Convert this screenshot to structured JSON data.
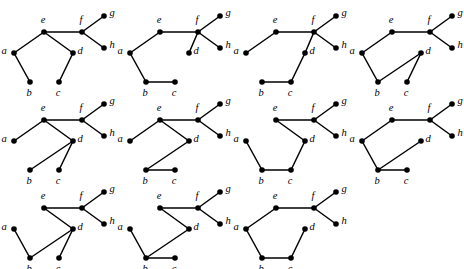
{
  "figure": {
    "caption": "",
    "vertex_labels": [
      "a",
      "b",
      "c",
      "d",
      "e",
      "f",
      "g",
      "h"
    ],
    "columns": 4,
    "rows": 3,
    "graph_count": 11,
    "vertex_radius": 2.8,
    "colors": {
      "edge": "#000000",
      "vertex": "#000000",
      "background": "#ffffff",
      "label": "#000000"
    },
    "layout": {
      "cell_width": 116,
      "cell_height": 88,
      "positions": {
        "a": {
          "x": 14,
          "y": 53
        },
        "b": {
          "x": 30,
          "y": 82
        },
        "c": {
          "x": 59,
          "y": 82
        },
        "d": {
          "x": 73,
          "y": 53
        },
        "e": {
          "x": 44,
          "y": 32
        },
        "f": {
          "x": 82,
          "y": 32
        },
        "g": {
          "x": 104,
          "y": 16
        },
        "h": {
          "x": 104,
          "y": 48
        }
      },
      "label_offsets": {
        "a": {
          "dx": -10,
          "dy": -1
        },
        "b": {
          "dx": -1,
          "dy": 12
        },
        "c": {
          "dx": -1,
          "dy": 12
        },
        "d": {
          "dx": 7,
          "dy": -1
        },
        "e": {
          "dx": -1,
          "dy": -11
        },
        "f": {
          "dx": -1,
          "dy": -11
        },
        "g": {
          "dx": 8,
          "dy": -2
        },
        "h": {
          "dx": 8,
          "dy": -2
        }
      }
    },
    "graphs": [
      {
        "id": "graph-1",
        "name": "graph-1",
        "row": 0,
        "col": 0,
        "edges": [
          [
            "a",
            "e"
          ],
          [
            "e",
            "f"
          ],
          [
            "e",
            "d"
          ],
          [
            "f",
            "g"
          ],
          [
            "f",
            "h"
          ],
          [
            "a",
            "b"
          ],
          [
            "d",
            "c"
          ]
        ]
      },
      {
        "id": "graph-2",
        "name": "graph-2",
        "row": 0,
        "col": 1,
        "edges": [
          [
            "a",
            "e"
          ],
          [
            "e",
            "f"
          ],
          [
            "f",
            "d"
          ],
          [
            "f",
            "g"
          ],
          [
            "f",
            "h"
          ],
          [
            "a",
            "b"
          ],
          [
            "b",
            "c"
          ]
        ]
      },
      {
        "id": "graph-3",
        "name": "graph-3",
        "row": 0,
        "col": 2,
        "edges": [
          [
            "a",
            "e"
          ],
          [
            "e",
            "f"
          ],
          [
            "f",
            "d"
          ],
          [
            "f",
            "g"
          ],
          [
            "f",
            "h"
          ],
          [
            "d",
            "c"
          ],
          [
            "c",
            "b"
          ]
        ]
      },
      {
        "id": "graph-4",
        "name": "graph-4",
        "row": 0,
        "col": 3,
        "edges": [
          [
            "a",
            "e"
          ],
          [
            "e",
            "f"
          ],
          [
            "f",
            "g"
          ],
          [
            "f",
            "h"
          ],
          [
            "a",
            "b"
          ],
          [
            "b",
            "d"
          ],
          [
            "d",
            "c"
          ]
        ]
      },
      {
        "id": "graph-5",
        "name": "graph-5",
        "row": 1,
        "col": 0,
        "edges": [
          [
            "a",
            "e"
          ],
          [
            "e",
            "f"
          ],
          [
            "e",
            "d"
          ],
          [
            "f",
            "g"
          ],
          [
            "f",
            "h"
          ],
          [
            "d",
            "b"
          ],
          [
            "d",
            "c"
          ]
        ]
      },
      {
        "id": "graph-6",
        "name": "graph-6",
        "row": 1,
        "col": 1,
        "edges": [
          [
            "a",
            "e"
          ],
          [
            "e",
            "f"
          ],
          [
            "e",
            "d"
          ],
          [
            "f",
            "g"
          ],
          [
            "f",
            "h"
          ],
          [
            "d",
            "b"
          ],
          [
            "b",
            "c"
          ]
        ]
      },
      {
        "id": "graph-7",
        "name": "graph-7",
        "row": 1,
        "col": 2,
        "edges": [
          [
            "e",
            "f"
          ],
          [
            "e",
            "d"
          ],
          [
            "f",
            "g"
          ],
          [
            "f",
            "h"
          ],
          [
            "a",
            "b"
          ],
          [
            "b",
            "c"
          ],
          [
            "c",
            "d"
          ]
        ]
      },
      {
        "id": "graph-8",
        "name": "graph-8",
        "row": 1,
        "col": 3,
        "edges": [
          [
            "a",
            "e"
          ],
          [
            "e",
            "f"
          ],
          [
            "f",
            "g"
          ],
          [
            "f",
            "h"
          ],
          [
            "a",
            "b"
          ],
          [
            "b",
            "d"
          ],
          [
            "b",
            "c"
          ]
        ]
      },
      {
        "id": "graph-9",
        "name": "graph-9",
        "row": 2,
        "col": 0,
        "edges": [
          [
            "e",
            "f"
          ],
          [
            "e",
            "d"
          ],
          [
            "f",
            "g"
          ],
          [
            "f",
            "h"
          ],
          [
            "a",
            "b"
          ],
          [
            "b",
            "d"
          ],
          [
            "d",
            "c"
          ]
        ]
      },
      {
        "id": "graph-10",
        "name": "graph-10",
        "row": 2,
        "col": 1,
        "edges": [
          [
            "e",
            "f"
          ],
          [
            "e",
            "d"
          ],
          [
            "f",
            "g"
          ],
          [
            "f",
            "h"
          ],
          [
            "a",
            "b"
          ],
          [
            "b",
            "d"
          ],
          [
            "b",
            "c"
          ]
        ]
      },
      {
        "id": "graph-11",
        "name": "graph-11",
        "row": 2,
        "col": 2,
        "edges": [
          [
            "a",
            "e"
          ],
          [
            "e",
            "f"
          ],
          [
            "f",
            "g"
          ],
          [
            "f",
            "h"
          ],
          [
            "a",
            "b"
          ],
          [
            "b",
            "c"
          ],
          [
            "c",
            "d"
          ]
        ]
      }
    ]
  }
}
